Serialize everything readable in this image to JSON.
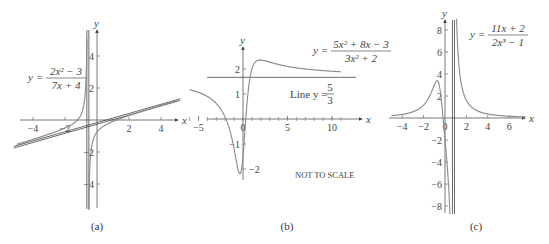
{
  "chart_data": [
    {
      "id": "a",
      "type": "line",
      "caption": "(a)",
      "equation": {
        "lhs": "y =",
        "numerator": "2x² − 3",
        "denominator": "7x + 4"
      },
      "function": "(2x^2-3)/(7x+4)",
      "xlabel": "x",
      "ylabel": "y",
      "xlim": [
        -5,
        5
      ],
      "ylim": [
        -5.5,
        5.5
      ],
      "x_ticks": [
        -4,
        -2,
        2,
        4
      ],
      "y_ticks": [
        -4,
        -2,
        2,
        4
      ],
      "vertical_asymptote": -0.571,
      "oblique_asymptote": {
        "slope": 0.2857,
        "intercept": -0.1633
      },
      "series": [
        {
          "name": "y = (2x²−3)/(7x+4)",
          "x": [
            -5,
            -4,
            -3,
            -2,
            -1,
            -0.8,
            -0.65,
            -0.6,
            -0.5,
            -0.4,
            -0.2,
            0,
            0.5,
            1,
            2,
            3,
            4,
            5
          ],
          "y": [
            -1.52,
            -1.21,
            -0.88,
            -0.5,
            0.33,
            1.3,
            4.5,
            11.6,
            -5.0,
            -2.2,
            -1.08,
            -0.75,
            -0.33,
            -0.09,
            0.28,
            0.6,
            0.91,
            1.21
          ]
        },
        {
          "name": "oblique asymptote",
          "x": [
            -5,
            5
          ],
          "y": [
            -1.59,
            1.27
          ]
        }
      ]
    },
    {
      "id": "b",
      "type": "line",
      "caption": "(b)",
      "equation": {
        "lhs": "y =",
        "numerator": "5x² + 8x − 3",
        "denominator": "3x² + 2"
      },
      "function": "(5x^2+8x-3)/(3x^2+2)",
      "line_label": {
        "text": "Line y =",
        "numerator": "5",
        "denominator": "3"
      },
      "note": "NOT TO SCALE",
      "xlabel": "x",
      "ylabel": "y",
      "xlim": [
        -6,
        11
      ],
      "ylim": [
        -2.5,
        2.8
      ],
      "x_ticks": [
        -5,
        0,
        5,
        10
      ],
      "y_ticks": [
        -2,
        -1,
        1,
        2
      ],
      "horizontal_asymptote": 1.667,
      "series": [
        {
          "name": "y = (5x²+8x−3)/(3x²+2)",
          "x": [
            -6,
            -5,
            -4,
            -3,
            -2,
            -1,
            -0.5,
            -0.3,
            0,
            0.3,
            0.5,
            1,
            2,
            3,
            5,
            8,
            11
          ],
          "y": [
            1.19,
            1.06,
            0.86,
            0.48,
            -0.21,
            -1.2,
            -2.09,
            -2.13,
            -1.5,
            -0.3,
            0.36,
            2.0,
            2.36,
            2.31,
            2.09,
            1.93,
            1.88
          ]
        },
        {
          "name": "Line y = 5/3",
          "x": [
            -6,
            11
          ],
          "y": [
            1.667,
            1.667
          ]
        }
      ]
    },
    {
      "id": "c",
      "type": "line",
      "caption": "(c)",
      "equation": {
        "lhs": "y =",
        "numerator": "11x + 2",
        "denominator": "2x³ − 1"
      },
      "function": "(11x+2)/(2x^3-1)",
      "xlabel": "x",
      "ylabel": "y",
      "xlim": [
        -5,
        7.5
      ],
      "ylim": [
        -8.8,
        9
      ],
      "x_ticks": [
        -4,
        -2,
        0,
        2,
        4,
        6
      ],
      "y_ticks": [
        -8,
        -6,
        -4,
        -2,
        2,
        4,
        6,
        8
      ],
      "vertical_asymptote": 0.794,
      "series": [
        {
          "name": "y = (11x+2)/(2x³−1)",
          "x": [
            -5,
            -4,
            -3,
            -2,
            -1,
            -0.6,
            0,
            0.5,
            0.7,
            1,
            2,
            4,
            6,
            7.5
          ],
          "y": [
            0.21,
            0.33,
            0.56,
            1.18,
            3.0,
            3.4,
            -2.0,
            -10.0,
            33.0,
            13.0,
            1.6,
            0.36,
            0.16,
            0.1
          ]
        }
      ]
    }
  ]
}
